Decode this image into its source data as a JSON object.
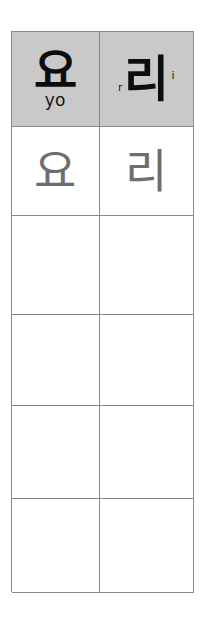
{
  "worksheet": {
    "type": "korean-handwriting-practice-table",
    "columns": 2,
    "rows": 6,
    "header_background": "#c9c9c9",
    "grid_line_color": "#8a8a8a",
    "trace_glyph_color": "#6e6e6e",
    "header_glyph_color": "#0d0d0d",
    "header": {
      "cells": [
        {
          "glyph": "요",
          "romanization": "yo",
          "superscript": "",
          "subscript": ""
        },
        {
          "glyph": "리",
          "romanization": "",
          "superscript": "r",
          "subscript": "i"
        }
      ]
    },
    "trace_row": {
      "cells": [
        {
          "glyph": "요"
        },
        {
          "glyph": "리"
        }
      ]
    },
    "blank_rows": [
      {
        "cells": [
          {
            "glyph": ""
          },
          {
            "glyph": ""
          }
        ]
      },
      {
        "cells": [
          {
            "glyph": ""
          },
          {
            "glyph": ""
          }
        ]
      },
      {
        "cells": [
          {
            "glyph": ""
          },
          {
            "glyph": ""
          }
        ]
      },
      {
        "cells": [
          {
            "glyph": ""
          },
          {
            "glyph": ""
          }
        ]
      }
    ]
  }
}
